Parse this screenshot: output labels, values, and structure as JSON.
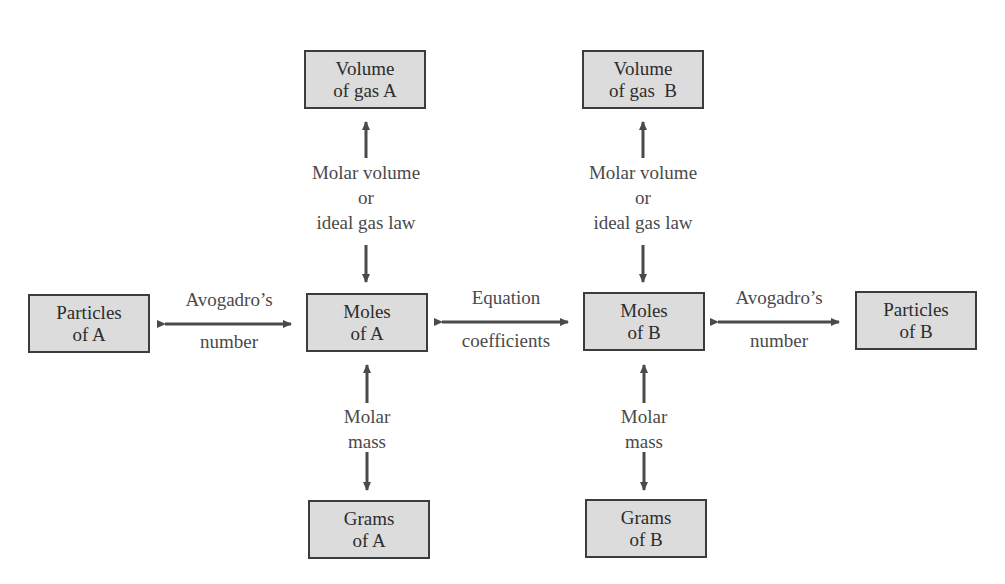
{
  "diagram": {
    "boxes": {
      "volume_a": {
        "line1": "Volume",
        "line2": "of gas A"
      },
      "volume_b": {
        "line1": "Volume",
        "line2": "of gas  B"
      },
      "particles_a": {
        "line1": "Particles",
        "line2": "of A"
      },
      "moles_a": {
        "line1": "Moles",
        "line2": "of A"
      },
      "moles_b": {
        "line1": "Moles",
        "line2": "of B"
      },
      "particles_b": {
        "line1": "Particles",
        "line2": "of B"
      },
      "grams_a": {
        "line1": "Grams",
        "line2": "of A"
      },
      "grams_b": {
        "line1": "Grams",
        "line2": "of B"
      }
    },
    "connectors": {
      "avogadro_a": {
        "line1": "Avogadro’s",
        "line2": "number"
      },
      "equation": {
        "line1": "Equation",
        "line2": "coefficients"
      },
      "avogadro_b": {
        "line1": "Avogadro’s",
        "line2": "number"
      },
      "gas_a": {
        "line1": "Molar volume",
        "line2": "or",
        "line3": "ideal gas law"
      },
      "gas_b": {
        "line1": "Molar volume",
        "line2": "or",
        "line3": "ideal gas law"
      },
      "mass_a": {
        "line1": "Molar",
        "line2": "mass"
      },
      "mass_b": {
        "line1": "Molar",
        "line2": "mass"
      }
    },
    "colors": {
      "box_fill": "#dcdcdc",
      "box_border": "#3c3c3c",
      "arrow": "#4a4a4a",
      "text": "#3a3a3a"
    }
  }
}
